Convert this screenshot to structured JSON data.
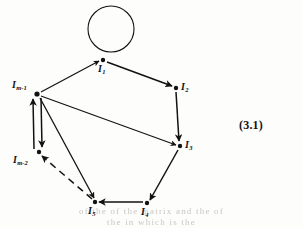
{
  "figure": {
    "equation_number": "(3.1)",
    "ink_color": "#121212",
    "background_color": "#fdfdfc",
    "bleed_color": "#c9c7c4"
  },
  "bleed_through": {
    "top": "",
    "line1": "of the of the matrix and the of",
    "line2": "the in which is the"
  },
  "nodes": [
    {
      "id": "I1",
      "base": "I",
      "sub": "1",
      "x": 103,
      "y": 60,
      "label_x": 98,
      "label_y": 64,
      "label_text": "I1"
    },
    {
      "id": "I2",
      "base": "I",
      "sub": "2",
      "x": 176,
      "y": 88,
      "label_x": 181,
      "label_y": 83,
      "label_text": "I2"
    },
    {
      "id": "I3",
      "base": "I",
      "sub": "3",
      "x": 180,
      "y": 146,
      "label_x": 185,
      "label_y": 141,
      "label_text": "I3"
    },
    {
      "id": "I4",
      "base": "I",
      "sub": "4",
      "x": 147,
      "y": 203,
      "label_x": 142,
      "label_y": 207,
      "label_text": "I4"
    },
    {
      "id": "I5",
      "base": "I",
      "sub": "5",
      "x": 95,
      "y": 202,
      "label_x": 89,
      "label_y": 206,
      "label_text": "I5"
    },
    {
      "id": "Im2",
      "base": "I",
      "sub": "m-2",
      "x": 39,
      "y": 152,
      "label_x": 14,
      "label_y": 157,
      "label_text": "Im-2"
    },
    {
      "id": "Im1",
      "base": "I",
      "sub": "m-1",
      "x": 37,
      "y": 94,
      "label_x": 13,
      "label_y": 81,
      "label_text": "Im-1"
    }
  ],
  "edges": [
    {
      "from": "I1",
      "to": "I1",
      "style": "solid",
      "kind": "self-loop"
    },
    {
      "from": "I1",
      "to": "I2",
      "style": "solid",
      "kind": "directed"
    },
    {
      "from": "I2",
      "to": "I3",
      "style": "solid",
      "kind": "directed"
    },
    {
      "from": "I3",
      "to": "I4",
      "style": "solid",
      "kind": "directed"
    },
    {
      "from": "I4",
      "to": "I5",
      "style": "solid",
      "kind": "directed"
    },
    {
      "from": "I5",
      "to": "Im2",
      "style": "dashed",
      "kind": "directed"
    },
    {
      "from": "Im2",
      "to": "Im1",
      "style": "solid",
      "kind": "directed"
    },
    {
      "from": "Im1",
      "to": "Im2",
      "style": "solid",
      "kind": "directed"
    },
    {
      "from": "Im1",
      "to": "I1",
      "style": "solid",
      "kind": "directed"
    },
    {
      "from": "Im1",
      "to": "I3",
      "style": "solid",
      "kind": "directed"
    },
    {
      "from": "Im1",
      "to": "I5",
      "style": "solid",
      "kind": "directed"
    }
  ],
  "self_loop": {
    "cx": 111,
    "cy": 29,
    "r": 23
  }
}
